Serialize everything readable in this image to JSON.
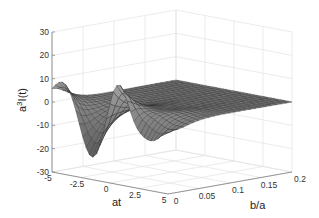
{
  "chart_data": {
    "type": "surface",
    "title": "",
    "xlabel": "at",
    "ylabel": "b/a",
    "zlabel": "a³I(t)",
    "zlabel_base": "a",
    "zlabel_sup": "3",
    "zlabel_rest": "I(t)",
    "xlim": [
      -5,
      5
    ],
    "ylim": [
      0,
      0.2
    ],
    "zlim": [
      -30,
      30
    ],
    "x_ticks": [
      -5,
      -2.5,
      0,
      2.5,
      5
    ],
    "x_tick_labels": [
      "-5",
      "-2.5",
      "0",
      "2.5",
      "5"
    ],
    "y_ticks": [
      0,
      0.05,
      0.1,
      0.15,
      0.2
    ],
    "y_tick_labels": [
      "0",
      "0.05",
      "0.1",
      "0.15",
      "0.2"
    ],
    "z_ticks": [
      -30,
      -20,
      -10,
      0,
      10,
      20,
      30
    ],
    "z_tick_labels": [
      "-30",
      "-20",
      "-10",
      "0",
      "10",
      "20",
      "30"
    ],
    "grid": true,
    "colormap": "gray",
    "surface_features": {
      "description": "Oscillating surface in at with amplitude decaying rapidly as b/a increases; flat near 0 for b/a > ~0.1",
      "peaks_at_b0": [
        {
          "at": -5,
          "z": 7
        },
        {
          "at": -3.3,
          "z": -25
        },
        {
          "at": -1.2,
          "z": 20
        },
        {
          "at": 1.8,
          "z": -30
        },
        {
          "at": 5,
          "z": 0
        }
      ]
    }
  }
}
